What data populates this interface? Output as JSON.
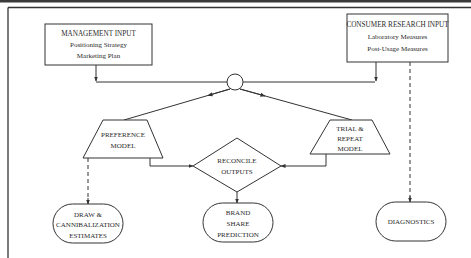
{
  "diagram": {
    "type": "flowchart",
    "frame": {
      "top_rule_color": "#333333",
      "background": "#ffffff"
    },
    "nodes": {
      "management_input": {
        "shape": "rectangle",
        "title": "MANAGEMENT INPUT",
        "lines": [
          "Positioning Strategy",
          "Marketing Plan"
        ]
      },
      "consumer_research_input": {
        "shape": "rectangle",
        "title": "CONSUMER RESEARCH INPUT",
        "lines": [
          "Laboratory Measures",
          "Post-Usage Measures"
        ]
      },
      "junction": {
        "shape": "circle",
        "label": ""
      },
      "preference_model": {
        "shape": "trapezoid",
        "lines": [
          "PREFERENCE",
          "MODEL"
        ]
      },
      "trial_repeat_model": {
        "shape": "trapezoid",
        "lines": [
          "TRIAL &",
          "REPEAT",
          "MODEL"
        ]
      },
      "reconcile_outputs": {
        "shape": "diamond",
        "lines": [
          "RECONCILE",
          "OUTPUTS"
        ]
      },
      "draw_cannibalization": {
        "shape": "rounded-terminal",
        "lines": [
          "DRAW &",
          "CANNIBALIZATION",
          "ESTIMATES"
        ]
      },
      "brand_share_prediction": {
        "shape": "rounded-terminal",
        "lines": [
          "BRAND",
          "SHARE",
          "PREDICTION"
        ]
      },
      "diagnostics": {
        "shape": "rounded-terminal",
        "lines": [
          "DIAGNOSTICS"
        ]
      }
    },
    "edges": [
      {
        "from": "management_input",
        "to": "junction",
        "style": "solid"
      },
      {
        "from": "consumer_research_input",
        "to": "junction",
        "style": "solid"
      },
      {
        "from": "junction",
        "to": "preference_model",
        "style": "solid"
      },
      {
        "from": "junction",
        "to": "trial_repeat_model",
        "style": "solid"
      },
      {
        "from": "preference_model",
        "to": "reconcile_outputs",
        "style": "solid"
      },
      {
        "from": "trial_repeat_model",
        "to": "reconcile_outputs",
        "style": "solid"
      },
      {
        "from": "reconcile_outputs",
        "to": "brand_share_prediction",
        "style": "solid"
      },
      {
        "from": "preference_model",
        "to": "draw_cannibalization",
        "style": "dashed"
      },
      {
        "from": "consumer_research_input",
        "to": "diagnostics",
        "style": "dashed"
      }
    ]
  }
}
